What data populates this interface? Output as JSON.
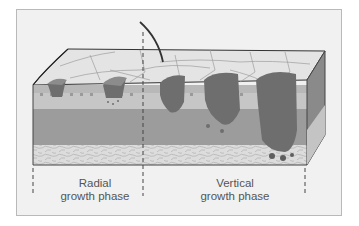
{
  "figure": {
    "labels": {
      "radial_line1": "Radial",
      "radial_line2": "growth phase",
      "vertical_line1": "Vertical",
      "vertical_line2": "growth phase"
    },
    "colors": {
      "frame_bg": "#f1f1f1",
      "surface": "#e4e4e4",
      "epidermis": "#b0b0b0",
      "dermis_upper": "#c3c3c3",
      "dermis_lower": "#9a9a9a",
      "subcutis": "#dadada",
      "tumor": "#6e6e6e",
      "tumor_rim": "#8c8c8c",
      "side_face": "#8a8a8a"
    }
  }
}
